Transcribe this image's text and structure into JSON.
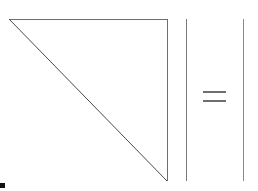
{
  "page": {
    "background_color": "#ffffff",
    "width": 258,
    "height": 191
  },
  "chart_data": {
    "type": "diagram",
    "title": "",
    "subtitle": "",
    "xlabel": "",
    "ylabel": "",
    "grid": false,
    "legend": null,
    "stroke_color": "#6e6e6e",
    "stroke_width": 1,
    "shapes": [
      {
        "name": "right-triangle",
        "kind": "polygon",
        "points": [
          [
            9,
            19
          ],
          [
            167,
            19
          ],
          [
            167,
            181
          ]
        ],
        "closed": true,
        "right_angle_at": "top-right",
        "fill": "none"
      },
      {
        "name": "vertical-bar-left",
        "kind": "line",
        "points": [
          [
            186,
            19
          ],
          [
            186,
            181
          ]
        ]
      },
      {
        "name": "equals-bar-upper",
        "kind": "line",
        "points": [
          [
            203,
            92
          ],
          [
            226,
            92
          ]
        ]
      },
      {
        "name": "equals-bar-lower",
        "kind": "line",
        "points": [
          [
            203,
            101
          ],
          [
            226,
            101
          ]
        ]
      },
      {
        "name": "vertical-bar-right",
        "kind": "line",
        "points": [
          [
            243,
            19
          ],
          [
            243,
            181
          ]
        ]
      }
    ],
    "markers": [
      {
        "name": "corner-marker",
        "kind": "rect",
        "x": 0,
        "y": 183,
        "width": 5,
        "height": 5,
        "color": "#111111"
      }
    ]
  },
  "labels": {
    "figure_alt": "Right triangle, vertical line, equals sign, vertical line",
    "equals_symbol": "=",
    "triangle_symbol": "right triangle",
    "bar_symbol": "|"
  }
}
